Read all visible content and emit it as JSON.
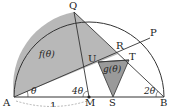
{
  "diagram": {
    "type": "semicircle-geometry",
    "colors": {
      "stroke": "#333333",
      "shade_f": "#b8b8b8",
      "shade_g": "#9a9a9a",
      "background": "#ffffff",
      "dashed": "#888888"
    },
    "points": {
      "A": {
        "label": "A"
      },
      "B": {
        "label": "B"
      },
      "M": {
        "label": "M"
      },
      "S": {
        "label": "S"
      },
      "Q": {
        "label": "Q"
      },
      "P": {
        "label": "P"
      },
      "R": {
        "label": "R"
      },
      "T": {
        "label": "T"
      },
      "U": {
        "label": "U"
      }
    },
    "regions": {
      "f": {
        "label": "f(θ)"
      },
      "g": {
        "label": "g(θ)"
      }
    },
    "angles": {
      "at_A": "θ",
      "at_M": "4θ",
      "at_B": "2θ"
    },
    "measure": {
      "AM": "1"
    }
  }
}
